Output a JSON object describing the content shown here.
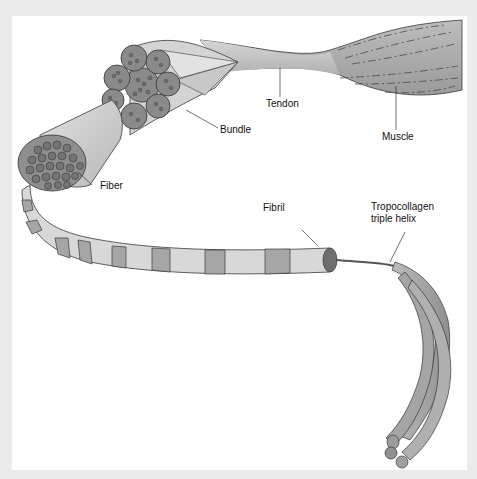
{
  "diagram": {
    "labels": {
      "tendon": "Tendon",
      "muscle": "Muscle",
      "bundle": "Bundle",
      "fiber": "Fiber",
      "fibril": "Fibril",
      "tropocollagen_line1": "Tropocollagen",
      "tropocollagen_line2": "triple helix"
    },
    "colors": {
      "outer_background": "#ebebeb",
      "panel": "#ffffff",
      "tissue_light": "#d9d9d9",
      "tissue_mid": "#b5b5b5",
      "tissue_dark": "#8e8e8e",
      "outline": "#3a3a3a"
    }
  }
}
